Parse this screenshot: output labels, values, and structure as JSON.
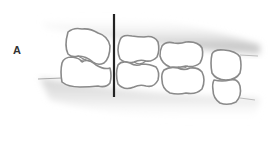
{
  "figure": {
    "panel_label": "A",
    "colors": {
      "tooth_fill": "#ffffff",
      "tooth_outline": "#8a8a8a",
      "gum_shadow": "#bdbdbd",
      "reference_line": "#222222"
    }
  }
}
